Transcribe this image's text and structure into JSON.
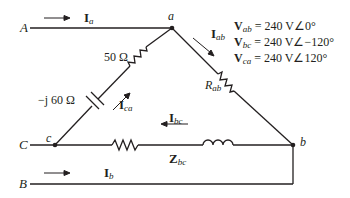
{
  "lines": {
    "A": "A",
    "B": "B",
    "C": "C"
  },
  "nodes": {
    "a": "a",
    "b": "b",
    "c": "c"
  },
  "currents": {
    "Ia": {
      "main": "I",
      "sub": "a"
    },
    "Ib": {
      "main": "I",
      "sub": "b"
    },
    "Iab": {
      "main": "I",
      "sub": "ab"
    },
    "Ibc": {
      "main": "I",
      "sub": "bc"
    },
    "Ica": {
      "main": "I",
      "sub": "ca"
    }
  },
  "components": {
    "resistor_ca": "50 Ω",
    "capacitor_ca": "−j 60 Ω",
    "resistor_ab": {
      "main": "R",
      "sub": "ab"
    },
    "impedance_bc": {
      "main": "Z",
      "sub": "bc"
    }
  },
  "voltages": [
    {
      "main": "V",
      "sub": "ab",
      "value": " = 240 V∠0°"
    },
    {
      "main": "V",
      "sub": "bc",
      "value": " = 240 V∠−120°"
    },
    {
      "main": "V",
      "sub": "ca",
      "value": " = 240 V∠120°"
    }
  ],
  "colors": {
    "ink": "#231f20",
    "background": "#ffffff"
  }
}
